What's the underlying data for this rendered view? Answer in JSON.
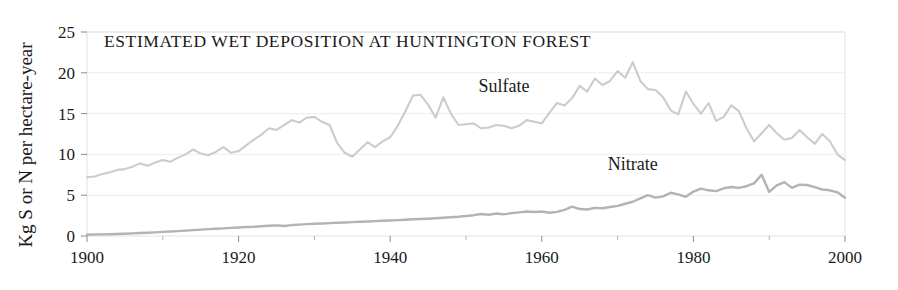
{
  "chart_data": {
    "type": "line",
    "title": "ESTIMATED  WET DEPOSITION AT HUNTINGTON FOREST",
    "xlabel": "",
    "ylabel": "Kg S or N per hectare-year",
    "xlim": [
      1900,
      2000
    ],
    "ylim": [
      0,
      25
    ],
    "xticks": [
      1900,
      1920,
      1940,
      1960,
      1980,
      2000
    ],
    "xtick_labels": [
      "1900",
      "1920",
      "1940",
      "1960",
      "1980",
      "2000"
    ],
    "xminor_ticks": [
      1910,
      1930,
      1950,
      1970,
      1990
    ],
    "yticks": [
      0,
      5,
      10,
      15,
      20,
      25
    ],
    "ytick_labels": [
      "0",
      "5",
      "10",
      "15",
      "20",
      "25"
    ],
    "grid": "horizontal-major-faint",
    "legend_position": "inline-annotations",
    "colors": {
      "sulfate_line": "#cccccc",
      "nitrate_line": "#b3b3b3",
      "gridline": "#ededed",
      "frame": "#e2e2e2",
      "text": "#1a1a1a",
      "background": "#ffffff"
    },
    "annotations": [
      {
        "text": "Sulfate",
        "x": 1955,
        "y": 17.6
      },
      {
        "text": "Nitrate",
        "x": 1972,
        "y": 8.1
      }
    ],
    "x": [
      1900,
      1901,
      1902,
      1903,
      1904,
      1905,
      1906,
      1907,
      1908,
      1909,
      1910,
      1911,
      1912,
      1913,
      1914,
      1915,
      1916,
      1917,
      1918,
      1919,
      1920,
      1921,
      1922,
      1923,
      1924,
      1925,
      1926,
      1927,
      1928,
      1929,
      1930,
      1931,
      1932,
      1933,
      1934,
      1935,
      1936,
      1937,
      1938,
      1939,
      1940,
      1941,
      1942,
      1943,
      1944,
      1945,
      1946,
      1947,
      1948,
      1949,
      1950,
      1951,
      1952,
      1953,
      1954,
      1955,
      1956,
      1957,
      1958,
      1959,
      1960,
      1961,
      1962,
      1963,
      1964,
      1965,
      1966,
      1967,
      1968,
      1969,
      1970,
      1971,
      1972,
      1973,
      1974,
      1975,
      1976,
      1977,
      1978,
      1979,
      1980,
      1981,
      1982,
      1983,
      1984,
      1985,
      1986,
      1987,
      1988,
      1989,
      1990,
      1991,
      1992,
      1993,
      1994,
      1995,
      1996,
      1997,
      1998,
      1999,
      2000
    ],
    "series": [
      {
        "name": "Sulfate",
        "color": "#cccccc",
        "values": [
          7.2,
          7.3,
          7.6,
          7.8,
          8.1,
          8.2,
          8.5,
          8.9,
          8.6,
          9.0,
          9.3,
          9.1,
          9.6,
          10.0,
          10.6,
          10.1,
          9.9,
          10.3,
          10.9,
          10.2,
          10.4,
          11.1,
          11.8,
          12.4,
          13.2,
          13.0,
          13.6,
          14.2,
          13.9,
          14.5,
          14.6,
          14.0,
          13.6,
          11.4,
          10.2,
          9.7,
          10.6,
          11.5,
          10.9,
          11.6,
          12.1,
          13.5,
          15.3,
          17.2,
          17.3,
          16.1,
          14.5,
          17.0,
          15.0,
          13.6,
          13.7,
          13.8,
          13.2,
          13.3,
          13.6,
          13.5,
          13.2,
          13.5,
          14.2,
          14.0,
          13.8,
          15.1,
          16.3,
          16.0,
          16.9,
          18.4,
          17.7,
          19.3,
          18.5,
          19.0,
          20.2,
          19.4,
          21.3,
          19.0,
          18.0,
          17.9,
          17.0,
          15.4,
          14.9,
          17.7,
          16.2,
          15.0,
          16.3,
          14.1,
          14.6,
          16.0,
          15.3,
          13.2,
          11.6,
          12.6,
          13.6,
          12.6,
          11.8,
          12.0,
          13.0,
          12.1,
          11.3,
          12.5,
          11.6,
          10.0,
          9.3
        ]
      },
      {
        "name": "Nitrate",
        "color": "#b3b3b3",
        "values": [
          0.15,
          0.18,
          0.2,
          0.22,
          0.25,
          0.28,
          0.32,
          0.36,
          0.4,
          0.44,
          0.5,
          0.55,
          0.6,
          0.66,
          0.72,
          0.78,
          0.84,
          0.88,
          0.94,
          1.0,
          1.05,
          1.1,
          1.14,
          1.2,
          1.26,
          1.3,
          1.22,
          1.34,
          1.4,
          1.45,
          1.5,
          1.54,
          1.58,
          1.62,
          1.66,
          1.7,
          1.74,
          1.78,
          1.82,
          1.86,
          1.9,
          1.95,
          2.0,
          2.05,
          2.08,
          2.12,
          2.18,
          2.24,
          2.3,
          2.36,
          2.45,
          2.55,
          2.7,
          2.6,
          2.75,
          2.65,
          2.8,
          2.9,
          3.0,
          2.95,
          3.0,
          2.85,
          2.95,
          3.2,
          3.6,
          3.3,
          3.25,
          3.45,
          3.4,
          3.55,
          3.7,
          3.95,
          4.2,
          4.6,
          5.0,
          4.7,
          4.85,
          5.3,
          5.1,
          4.8,
          5.45,
          5.8,
          5.6,
          5.5,
          5.85,
          6.0,
          5.9,
          6.1,
          6.45,
          7.5,
          5.4,
          6.2,
          6.6,
          5.9,
          6.3,
          6.25,
          6.0,
          5.7,
          5.6,
          5.35,
          4.7
        ]
      }
    ]
  }
}
